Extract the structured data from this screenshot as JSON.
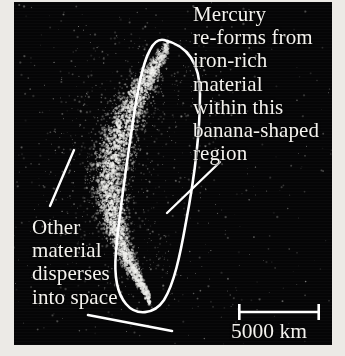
{
  "figure": {
    "panel": {
      "background_color": "#050506",
      "paper_color": "#eceae6",
      "width": 318,
      "height": 343
    }
  },
  "annotations": {
    "right": {
      "name": "mercury-reforms-annotation",
      "lines": [
        "Mercury",
        "re-forms from",
        "iron-rich",
        "material",
        "within this",
        "banana-shaped",
        "region"
      ]
    },
    "left": {
      "name": "other-material-annotation",
      "lines": [
        "Other",
        "material",
        "disperses",
        "into space"
      ]
    }
  },
  "scale_bar": {
    "label": "5000 km",
    "value": 5000,
    "units": "km",
    "pixel_length": 80,
    "color": "#ffffff"
  },
  "shapes": {
    "banana_outline": {
      "name": "banana-shaped-region-outline",
      "stroke": "#ffffff",
      "stroke_width": 2.6,
      "description": "Elongated curved banana-shaped closed outline enclosing the dense particle concentration"
    },
    "leader_lines": [
      {
        "name": "leader-line-upper-left",
        "x1": 36,
        "y1": 204,
        "x2": 60,
        "y2": 148
      },
      {
        "name": "leader-line-lower-left",
        "x1": 74,
        "y1": 313,
        "x2": 158,
        "y2": 329
      },
      {
        "name": "leader-line-region",
        "x1": 206,
        "y1": 160,
        "x2": 153,
        "y2": 211
      }
    ]
  },
  "particle_field": {
    "description": "Scatter of bright gray particles on black background; dense bright concentration inside the banana region, sparser dispersal outward",
    "dense_color": "#cfcdc8",
    "sparse_color": "#8d8b88",
    "outer_count": 1500,
    "inner_count": 2600
  }
}
